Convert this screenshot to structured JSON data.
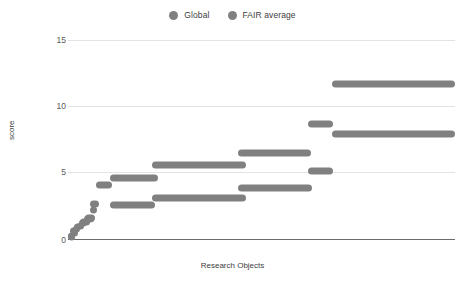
{
  "chart_data": {
    "type": "scatter",
    "title": "",
    "xlabel": "Research Objects",
    "ylabel": "score",
    "ylim": [
      0,
      16
    ],
    "yticks": [
      0,
      5,
      10,
      15
    ],
    "ytick_labels": [
      "0",
      "5",
      "10",
      "15"
    ],
    "xticks": [],
    "xtick_labels": [],
    "grid": "horizontal",
    "legend_position": "top-center",
    "marker": "circle",
    "series": [
      {
        "name": "Global",
        "color": "#808080",
        "points": [
          {
            "x_start": 0.0,
            "x_end": 1.2,
            "score": 0.25
          },
          {
            "x_start": 0.8,
            "x_end": 2.2,
            "score": 0.55
          },
          {
            "x_start": 1.4,
            "x_end": 3.0,
            "score": 0.85
          },
          {
            "x_start": 2.2,
            "x_end": 4.2,
            "score": 1.15
          },
          {
            "x_start": 3.2,
            "x_end": 5.6,
            "score": 1.45
          },
          {
            "x_start": 4.4,
            "x_end": 7.0,
            "score": 1.75
          },
          {
            "x_start": 5.8,
            "x_end": 7.2,
            "score": 2.4
          },
          {
            "x_start": 10.9,
            "x_end": 22.5,
            "score": 2.8
          },
          {
            "x_start": 21.7,
            "x_end": 46.0,
            "score": 3.4
          },
          {
            "x_start": 44.0,
            "x_end": 63.0,
            "score": 4.2
          },
          {
            "x_start": 62.0,
            "x_end": 68.5,
            "score": 5.5
          },
          {
            "x_start": 68.2,
            "x_end": 100.0,
            "score": 8.5
          }
        ]
      },
      {
        "name": "FAIR average",
        "color": "#808080",
        "points": [
          {
            "x_start": 0.0,
            "x_end": 1.0,
            "score": 0.3
          },
          {
            "x_start": 0.6,
            "x_end": 2.0,
            "score": 0.7
          },
          {
            "x_start": 1.6,
            "x_end": 3.4,
            "score": 1.05
          },
          {
            "x_start": 2.8,
            "x_end": 5.0,
            "score": 1.4
          },
          {
            "x_start": 4.2,
            "x_end": 6.8,
            "score": 1.7
          },
          {
            "x_start": 5.6,
            "x_end": 8.0,
            "score": 2.9
          },
          {
            "x_start": 7.2,
            "x_end": 11.4,
            "score": 4.4
          },
          {
            "x_start": 10.8,
            "x_end": 23.3,
            "score": 5.0
          },
          {
            "x_start": 21.7,
            "x_end": 46.0,
            "score": 6.0
          },
          {
            "x_start": 44.0,
            "x_end": 62.8,
            "score": 7.0
          },
          {
            "x_start": 62.0,
            "x_end": 68.5,
            "score": 9.3
          },
          {
            "x_start": 68.2,
            "x_end": 100.0,
            "score": 12.5
          }
        ]
      }
    ]
  },
  "legend": {
    "items": [
      {
        "label": "Global",
        "color": "#808080"
      },
      {
        "label": "FAIR average",
        "color": "#808080"
      }
    ]
  },
  "axes": {
    "y_title": "score",
    "x_title": "Research Objects",
    "y_tick_labels": [
      "15",
      "10",
      "5",
      "0"
    ]
  },
  "colors": {
    "marker": "#808080",
    "grid": "#e3e3e3",
    "axis": "#6b6b6b",
    "text": "#3c3c3c",
    "background": "#ffffff"
  }
}
